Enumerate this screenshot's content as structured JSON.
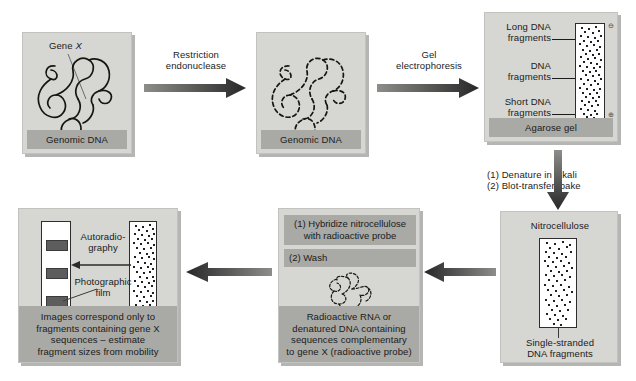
{
  "figure": {
    "colors": {
      "panel_bg": "#d6d6d2",
      "caption_bg": "#a9a9a5",
      "arrow_dark": "#3a3a3a",
      "band": "#5d5d5d",
      "ink": "#1b1b1b"
    }
  },
  "panel_genomic_dna": {
    "gene_label": "Gene X",
    "gene_label_plain": "Gene ",
    "gene_label_italic": "X",
    "caption": "Genomic DNA"
  },
  "arrow_restriction": {
    "label_line1": "Restriction",
    "label_line2": "endonuclease"
  },
  "panel_digested_dna": {
    "caption": "Genomic DNA"
  },
  "arrow_electrophoresis": {
    "label_line1": "Gel",
    "label_line2": "electrophoresis"
  },
  "panel_agarose_gel": {
    "label_long_line1": "Long DNA",
    "label_long_line2": "fragments",
    "label_mid_line1": "DNA",
    "label_mid_line2": "fragments",
    "label_short_line1": "Short DNA",
    "label_short_line2": "fragments",
    "electrode_negative": "⊖",
    "electrode_positive": "⊕",
    "caption": "Agarose gel"
  },
  "arrow_blot": {
    "step1": "(1) Denature in alkali",
    "step2": "(2) Blot-transfer, bake"
  },
  "panel_nitrocellulose": {
    "title": "Nitrocellulose",
    "label_line1": "Single-stranded",
    "label_line2": "DNA fragments"
  },
  "panel_hybridize": {
    "step1_line1": "(1) Hybridize nitrocellulose",
    "step1_line2": "with radioactive probe",
    "step2": "(2) Wash",
    "caption_line1": "Radioactive RNA or",
    "caption_line2": "denatured DNA containing",
    "caption_line3": "sequences complementary",
    "caption_line4": "to gene X (radioactive probe)"
  },
  "panel_autoradiography": {
    "label_autorad_line1": "Autoradio-",
    "label_autorad_line2": "graphy",
    "label_film_line1": "Photographic",
    "label_film_line2": "film",
    "caption_line1": "Images correspond only to",
    "caption_line2": "fragments containing gene X",
    "caption_line3": "sequences – estimate",
    "caption_line4": "fragment sizes from mobility"
  }
}
